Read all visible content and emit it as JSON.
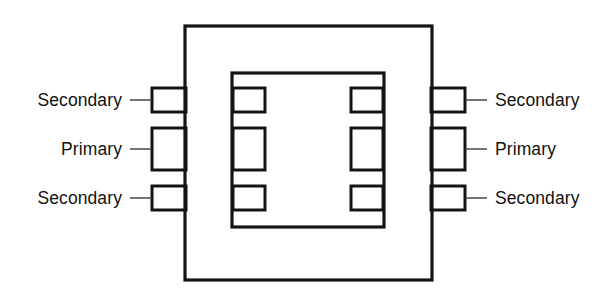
{
  "diagram": {
    "type": "schematic-cross-section",
    "stroke_color": "#141414",
    "leader_color": "#3a3a3a",
    "background_color": "#ffffff",
    "outer_core": {
      "name": "outer core rectangle",
      "x": 185,
      "y": 26,
      "width": 247,
      "height": 254,
      "stroke_width": 3.2
    },
    "inner_window": {
      "name": "inner core window rectangle",
      "x": 232,
      "y": 73,
      "width": 152,
      "height": 154,
      "stroke_width": 3.2
    },
    "windings": {
      "left_outer_tabs": [
        {
          "label": "Secondary",
          "x": 152,
          "y": 88,
          "width": 34,
          "height": 24
        },
        {
          "label": "Primary",
          "x": 152,
          "y": 128,
          "width": 34,
          "height": 42
        },
        {
          "label": "Secondary",
          "x": 152,
          "y": 186,
          "width": 34,
          "height": 24
        }
      ],
      "right_outer_tabs": [
        {
          "label": "Secondary",
          "x": 431,
          "y": 88,
          "width": 34,
          "height": 24
        },
        {
          "label": "Primary",
          "x": 431,
          "y": 128,
          "width": 34,
          "height": 42
        },
        {
          "label": "Secondary",
          "x": 431,
          "y": 186,
          "width": 34,
          "height": 24
        }
      ],
      "left_inner_blocks": [
        {
          "x": 233,
          "y": 88,
          "width": 32,
          "height": 24
        },
        {
          "x": 233,
          "y": 128,
          "width": 32,
          "height": 42
        },
        {
          "x": 233,
          "y": 186,
          "width": 32,
          "height": 24
        }
      ],
      "right_inner_blocks": [
        {
          "x": 351,
          "y": 88,
          "width": 32,
          "height": 24
        },
        {
          "x": 351,
          "y": 128,
          "width": 32,
          "height": 42
        },
        {
          "x": 351,
          "y": 186,
          "width": 32,
          "height": 24
        }
      ]
    },
    "leader_lines": {
      "left": [
        {
          "x1": 130,
          "y1": 100,
          "x2": 152,
          "y2": 100
        },
        {
          "x1": 130,
          "y1": 149,
          "x2": 152,
          "y2": 149
        },
        {
          "x1": 130,
          "y1": 198,
          "x2": 152,
          "y2": 198
        }
      ],
      "right": [
        {
          "x1": 465,
          "y1": 100,
          "x2": 487,
          "y2": 100
        },
        {
          "x1": 465,
          "y1": 149,
          "x2": 487,
          "y2": 149
        },
        {
          "x1": 465,
          "y1": 198,
          "x2": 487,
          "y2": 198
        }
      ]
    },
    "labels": {
      "left": [
        {
          "text": "Secondary",
          "x": 122,
          "y": 106
        },
        {
          "text": "Primary",
          "x": 122,
          "y": 155
        },
        {
          "text": "Secondary",
          "x": 122,
          "y": 204
        }
      ],
      "right": [
        {
          "text": "Secondary",
          "x": 495,
          "y": 106
        },
        {
          "text": "Primary",
          "x": 495,
          "y": 155
        },
        {
          "text": "Secondary",
          "x": 495,
          "y": 204
        }
      ]
    }
  }
}
